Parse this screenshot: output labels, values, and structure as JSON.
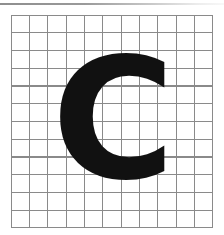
{
  "page": {
    "background_color": "#ffffff",
    "width": 224,
    "height": 235,
    "top_rule_color": "#8e8e8e"
  },
  "grid": {
    "name": "graph-paper-grid",
    "columns": 11,
    "rows": 12,
    "cell_width": 18.4,
    "cell_height": 17.8,
    "line_color": "#8a8a8a",
    "line_width": 1.1,
    "origin_x": 11,
    "origin_y": 15,
    "width": 202,
    "height": 213
  },
  "glyph": {
    "name": "letter-c",
    "character": "C",
    "case": "uppercase",
    "color": "#111111",
    "style": "bold sans-serif",
    "font_size_px": 168,
    "bounds": {
      "left": 64,
      "top": 66,
      "right": 163,
      "bottom": 178,
      "width": 99,
      "height": 112
    },
    "grid_span": {
      "columns": "3-8",
      "rows": "3-9"
    }
  },
  "caption": {
    "description": "Bold capital letter C drawn on ruled graph paper",
    "alt_text": "Handwriting / penmanship practice sheet showing the capital letter C"
  }
}
